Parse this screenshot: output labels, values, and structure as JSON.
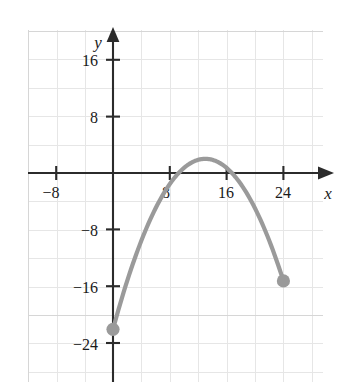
{
  "chart_data": {
    "type": "line",
    "title": "",
    "subtitle": "",
    "xlabel": "x",
    "ylabel": "y",
    "xlim": [
      -12,
      28
    ],
    "ylim": [
      -28,
      20
    ],
    "xticks": [
      -8,
      8,
      16,
      24
    ],
    "xtick_labels": [
      "−8",
      "8",
      "16",
      "24"
    ],
    "yticks": [
      16,
      8,
      -8,
      -16,
      -24
    ],
    "ytick_labels": [
      "16",
      "8",
      "−8",
      "−16",
      "−24"
    ],
    "grid": true,
    "grid_step": 4,
    "legend": null,
    "annotations": [],
    "series": [
      {
        "name": "parabola",
        "type": "quadratic",
        "color": "#9a9a9a",
        "vertex": [
          13,
          2
        ],
        "leading_coefficient": -0.1421,
        "domain": [
          0,
          24
        ],
        "endpoints": [
          {
            "x": 0,
            "y": -22,
            "marker": "filled-circle"
          },
          {
            "x": 24,
            "y": -15.2,
            "marker": "filled-circle"
          }
        ],
        "roots": [
          7.25,
          18.75
        ],
        "points": [
          {
            "x": 0,
            "y": -22
          },
          {
            "x": 2,
            "y": -15.2
          },
          {
            "x": 4,
            "y": -9.5
          },
          {
            "x": 6,
            "y": -5
          },
          {
            "x": 8,
            "y": -1.6
          },
          {
            "x": 10,
            "y": 0.7
          },
          {
            "x": 12,
            "y": 1.9
          },
          {
            "x": 13,
            "y": 2
          },
          {
            "x": 14,
            "y": 1.9
          },
          {
            "x": 16,
            "y": 0.7
          },
          {
            "x": 18,
            "y": -1.6
          },
          {
            "x": 20,
            "y": -5
          },
          {
            "x": 22,
            "y": -9.5
          },
          {
            "x": 24,
            "y": -15.2
          }
        ]
      }
    ],
    "colors": {
      "curve": "#9a9a9a",
      "marker": "#9a9a9a",
      "axis": "#2b2b2b",
      "grid": "#e4e4e4",
      "frame": "#e0e0e0",
      "text": "#1a1a1a",
      "background": "#ffffff"
    }
  }
}
